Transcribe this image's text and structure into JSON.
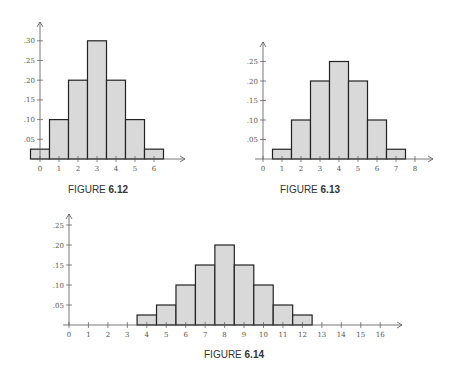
{
  "colors": {
    "bar_fill": "#d9d9d9",
    "bar_stroke": "#222222",
    "axis": "#555555"
  },
  "chart_data": [
    {
      "type": "bar",
      "title": "FIGURE 6.12",
      "caption_prefix": "FIGURE",
      "caption_number": "6.12",
      "categories": [
        0,
        1,
        2,
        3,
        4,
        5,
        6
      ],
      "values": [
        0.025,
        0.1,
        0.2,
        0.3,
        0.2,
        0.1,
        0.025
      ],
      "x_ticks": [
        0,
        1,
        2,
        3,
        4,
        5,
        6
      ],
      "y_ticks": [
        ".05",
        ".10",
        ".15",
        ".20",
        ".25",
        ".30"
      ],
      "xlabel": "",
      "ylabel": "",
      "ylim": [
        0,
        0.33
      ],
      "grid": false,
      "layout": {
        "ox": 40,
        "oy": 159,
        "xstep": 19,
        "ystep_per_05": 19.7,
        "x_end": 185,
        "y_top": 22
      }
    },
    {
      "type": "bar",
      "title": "FIGURE 6.13",
      "caption_prefix": "FIGURE",
      "caption_number": "6.13",
      "categories": [
        1,
        2,
        3,
        4,
        5,
        6,
        7
      ],
      "values": [
        0.025,
        0.1,
        0.2,
        0.25,
        0.2,
        0.1,
        0.025
      ],
      "x_ticks": [
        0,
        1,
        2,
        3,
        4,
        5,
        6,
        7,
        8
      ],
      "y_ticks": [
        ".05",
        ".10",
        ".15",
        ".20",
        ".25"
      ],
      "xlabel": "",
      "ylabel": "",
      "ylim": [
        0,
        0.28
      ],
      "grid": false,
      "layout": {
        "ox": 263,
        "oy": 159,
        "xstep": 19,
        "ystep_per_05": 19.5,
        "x_end": 433,
        "y_top": 42
      }
    },
    {
      "type": "bar",
      "title": "FIGURE 6.14",
      "caption_prefix": "FIGURE",
      "caption_number": "6.14",
      "categories": [
        4,
        5,
        6,
        7,
        8,
        9,
        10,
        11,
        12
      ],
      "values": [
        0.025,
        0.05,
        0.1,
        0.15,
        0.2,
        0.15,
        0.1,
        0.05,
        0.025
      ],
      "x_ticks": [
        0,
        1,
        2,
        3,
        4,
        5,
        6,
        7,
        8,
        9,
        10,
        11,
        12,
        13,
        14,
        15,
        16
      ],
      "y_ticks": [
        ".05",
        ".10",
        ".15",
        ".20",
        ".25"
      ],
      "xlabel": "",
      "ylabel": "",
      "ylim": [
        0,
        0.27
      ],
      "grid": false,
      "layout": {
        "ox": 69,
        "oy": 325,
        "xstep": 19.45,
        "ystep_per_05": 20,
        "x_end": 402,
        "y_top": 214
      }
    }
  ]
}
